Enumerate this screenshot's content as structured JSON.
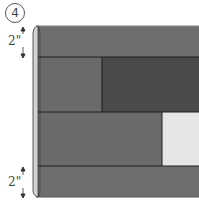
{
  "step": {
    "number": "4"
  },
  "dimensions": {
    "top": {
      "label": "2\""
    },
    "bottom": {
      "label": "2\""
    }
  },
  "colors": {
    "top_strip": "#6e6e6e",
    "row2_left": "#6a6a6a",
    "row2_right": "#4a4a4a",
    "row3_left": "#6b6b6b",
    "row3_right": "#e6e6e6",
    "bottom_strip": "#6e6e6e",
    "rolled_edge": "#d0d0d0",
    "seam": "#1e1e1e"
  }
}
